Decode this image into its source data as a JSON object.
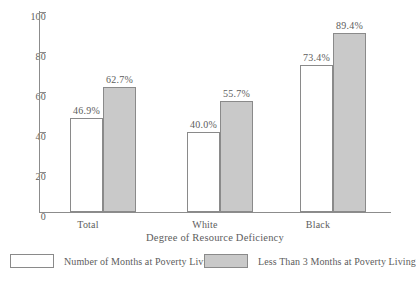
{
  "chart_data": {
    "type": "bar",
    "title": "",
    "subtitle": "",
    "xlabel": "Degree of Resource Deficiency",
    "ylabel": "",
    "ylim": [
      0,
      100
    ],
    "yticks": [
      "0",
      "20",
      "40",
      "60",
      "80",
      "100"
    ],
    "ytick_values": [
      0,
      20,
      40,
      60,
      80,
      100
    ],
    "grid": false,
    "legend_position": "bottom",
    "categories": [
      "Total",
      "White",
      "Black"
    ],
    "series": [
      {
        "name": "Number of Months at Poverty Living",
        "color": "#ffffff",
        "values": [
          46.9,
          40.0,
          55.7
        ],
        "labels": [
          "46.9%",
          "40.0%",
          "73.4%"
        ],
        "values_corrected": [
          46.9,
          40.0,
          73.4
        ]
      },
      {
        "name": "Less Than 3 Months at Poverty Living",
        "color": "#c9c9c9",
        "values": [
          62.7,
          55.7,
          89.4
        ],
        "labels": [
          "62.7%",
          "55.7%",
          "89.4%"
        ]
      }
    ]
  },
  "axes": {
    "xlabel": "Degree of Resource Deficiency",
    "ytick_labels": [
      "100",
      "80",
      "60",
      "40",
      "20",
      "0"
    ],
    "category_labels": [
      "Total",
      "White",
      "Black"
    ]
  },
  "bars": [
    {
      "group": "Total",
      "series": "Number of Months at Poverty Living",
      "value": 46.9,
      "label": "46.9%",
      "fill": "white"
    },
    {
      "group": "Total",
      "series": "Less Than 3 Months at Poverty Living",
      "value": 62.7,
      "label": "62.7%",
      "fill": "gray"
    },
    {
      "group": "White",
      "series": "Number of Months at Poverty Living",
      "value": 40.0,
      "label": "40.0%",
      "fill": "white"
    },
    {
      "group": "White",
      "series": "Less Than 3 Months at Poverty Living",
      "value": 55.7,
      "label": "55.7%",
      "fill": "gray"
    },
    {
      "group": "Black",
      "series": "Number of Months at Poverty Living",
      "value": 73.4,
      "label": "73.4%",
      "fill": "white"
    },
    {
      "group": "Black",
      "series": "Less Than 3 Months at Poverty Living",
      "value": 89.4,
      "label": "89.4%",
      "fill": "gray"
    }
  ],
  "legend": {
    "entries": [
      {
        "label": "Number of Months at Poverty Living",
        "swatch": "white"
      },
      {
        "label": "Less Than 3 Months at Poverty Living",
        "swatch": "gray"
      }
    ]
  },
  "colors": {
    "bar_white_fill": "#ffffff",
    "bar_gray_fill": "#c9c9c9",
    "bar_stroke": "#8a8a8a",
    "axis": "#8c8c8c",
    "text": "#5d5d5d"
  }
}
